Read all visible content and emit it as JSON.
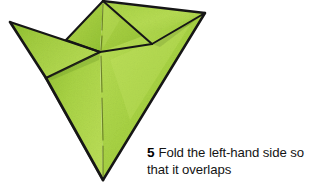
{
  "page": {
    "background_color": "#ffffff",
    "width": 309,
    "height": 183
  },
  "illustration": {
    "name": "origami-paper-model",
    "subject": "folded green paper origami form with two upward wings and a downward point",
    "paper_color_light": "#b4d94e",
    "paper_color_mid": "#9dc93a",
    "paper_color_dark": "#83b52e",
    "outline_color": "#1a1a1a",
    "crease_color": "#4a5a20",
    "shadow_color": "#2a3510"
  },
  "caption": {
    "step_number": "5",
    "text": "Fold the left-hand side so that it overlaps",
    "text_color": "#141414"
  }
}
